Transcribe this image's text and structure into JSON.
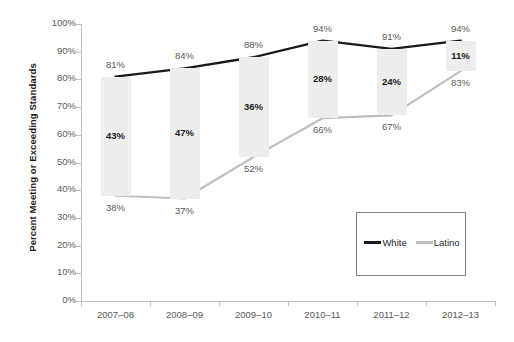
{
  "chart_data": {
    "type": "line",
    "title": "",
    "xlabel": "",
    "ylabel": "Percent Meeting or Exceeding Standards",
    "categories": [
      "2007–08",
      "2008–09",
      "2009–10",
      "2010–11",
      "2011–12",
      "2012–13"
    ],
    "ylim": [
      0,
      100
    ],
    "ytick_labels": [
      "0%",
      "10%",
      "20%",
      "30%",
      "40%",
      "50%",
      "60%",
      "70%",
      "80%",
      "90%",
      "100%"
    ],
    "ytick_values": [
      0,
      10,
      20,
      30,
      40,
      50,
      60,
      70,
      80,
      90,
      100
    ],
    "grid": false,
    "legend_position": "bottom-right",
    "series": [
      {
        "name": "White",
        "color": "#1a1a1a",
        "values": [
          81,
          84,
          88,
          94,
          91,
          94
        ],
        "labels": [
          "81%",
          "84%",
          "88%",
          "94%",
          "91%",
          "94%"
        ]
      },
      {
        "name": "Latino",
        "color": "#bfbfbf",
        "values": [
          38,
          37,
          52,
          66,
          67,
          83
        ],
        "labels": [
          "38%",
          "37%",
          "52%",
          "66%",
          "67%",
          "83%"
        ]
      }
    ],
    "gap_bars": {
      "name": "Gap",
      "color": "#ededed",
      "values": [
        43,
        47,
        36,
        28,
        24,
        11
      ],
      "labels": [
        "43%",
        "47%",
        "36%",
        "28%",
        "24%",
        "11%"
      ]
    },
    "annotations": []
  },
  "legend": {
    "entries": [
      {
        "label": "White",
        "color": "#1a1a1a"
      },
      {
        "label": "Latino",
        "color": "#bfbfbf"
      }
    ]
  },
  "colors": {
    "white_series": "#1a1a1a",
    "latino_series": "#bfbfbf",
    "gap_bar": "#ededed",
    "axis": "#bfbfbf",
    "tick_text": "#595959",
    "background": "#ffffff"
  }
}
